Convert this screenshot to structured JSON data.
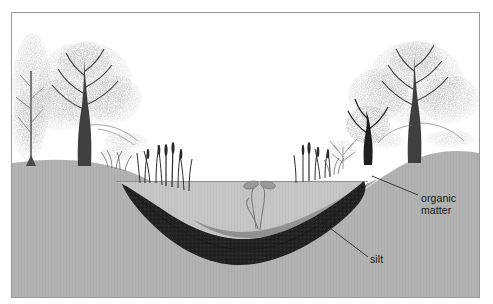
{
  "figure": {
    "type": "cross-section-illustration",
    "frame": {
      "border_color": "#9a9a9a",
      "background": "#ffffff"
    }
  },
  "labels": [
    {
      "id": "organic",
      "text": "organic\nmatter",
      "leader": true
    },
    {
      "id": "silt",
      "text": "silt",
      "leader": true
    }
  ],
  "label_text": {
    "organic_matter": "organic\nmatter",
    "silt": "silt"
  },
  "palette": {
    "sky": "#ffffff",
    "upland_ground": "#b3b3b3",
    "water": "#c6c6c6",
    "water_surface_line": "#8e8e8e",
    "organic_matter": "#9a9a9a",
    "silt": "#252525",
    "tree_foliage": "#9b9b9b",
    "tree_trunk": "#3a3a3a",
    "reeds": "#2b2b2b",
    "aquatic_plant": "#8d8d8d",
    "leader_line": "#2a2a2a",
    "label_text": "#16181a"
  },
  "scene": {
    "layers": [
      {
        "name": "sky",
        "order": 1
      },
      {
        "name": "upland-ground",
        "order": 2
      },
      {
        "name": "pond-water",
        "order": 3
      },
      {
        "name": "organic-matter-wedge",
        "order": 4
      },
      {
        "name": "silt-layer",
        "order": 5
      }
    ],
    "vegetation": {
      "left_trees": 3,
      "right_trees": 3,
      "left_reed_clumps": 2,
      "right_reed_clumps": 2,
      "aquatic_plants": 1
    }
  }
}
